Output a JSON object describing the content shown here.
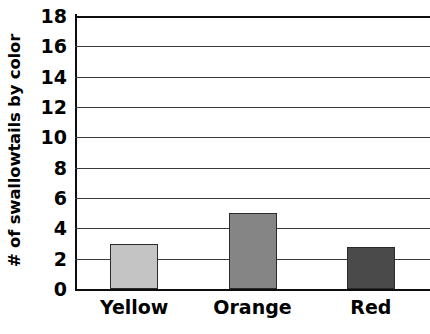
{
  "chart_data": {
    "type": "bar",
    "title": "",
    "subtitle": "",
    "xlabel": "",
    "ylabel": "# of swallowtails by color",
    "categories": [
      "Yellow",
      "Orange",
      "Red"
    ],
    "values": [
      3,
      5,
      2.8
    ],
    "series": [
      {
        "name": "# of swallowtails by color",
        "values": [
          3,
          5,
          2.8
        ]
      }
    ],
    "bar_colors": [
      "#c4c4c4",
      "#858585",
      "#4a4a4a"
    ],
    "bar_edge_color": "#2b2b2b",
    "ylim": [
      0,
      18
    ],
    "ytick_step": 2,
    "yticks": [
      0,
      2,
      4,
      6,
      8,
      10,
      12,
      14,
      16,
      18
    ],
    "ytick_labels": [
      "0",
      "2",
      "4",
      "6",
      "8",
      "10",
      "12",
      "14",
      "16",
      "18"
    ],
    "grid": true,
    "grid_axis": "y",
    "grid_color": "#3a3a3a",
    "legend": false,
    "legend_position": "none",
    "axis_color": "#0d0d0d",
    "background_color": "#ffffff",
    "annotations": []
  }
}
